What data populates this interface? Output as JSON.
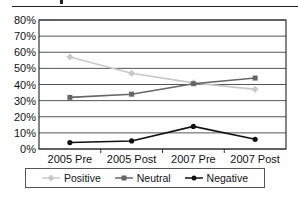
{
  "chart_data": {
    "type": "line",
    "title": "",
    "xlabel": "",
    "ylabel": "",
    "categories": [
      "2005 Pre",
      "2005 Post",
      "2007 Pre",
      "2007 Post"
    ],
    "yticks": [
      "0%",
      "10%",
      "20%",
      "30%",
      "40%",
      "50%",
      "60%",
      "70%",
      "80%"
    ],
    "ylim": [
      0,
      80
    ],
    "grid": true,
    "legend_position": "bottom",
    "series": [
      {
        "name": "Positive",
        "color": "#c8c8c8",
        "marker": "diamond",
        "values": [
          57,
          47,
          41,
          37
        ]
      },
      {
        "name": "Neutral",
        "color": "#666666",
        "marker": "square",
        "values": [
          32,
          34,
          40.5,
          44
        ]
      },
      {
        "name": "Negative",
        "color": "#111111",
        "marker": "circle",
        "values": [
          4,
          5,
          14,
          6
        ]
      }
    ]
  },
  "legend": {
    "items": [
      {
        "label": "Positive",
        "color": "#c8c8c8"
      },
      {
        "label": "Neutral",
        "color": "#666666"
      },
      {
        "label": "Negative",
        "color": "#111111"
      }
    ]
  }
}
